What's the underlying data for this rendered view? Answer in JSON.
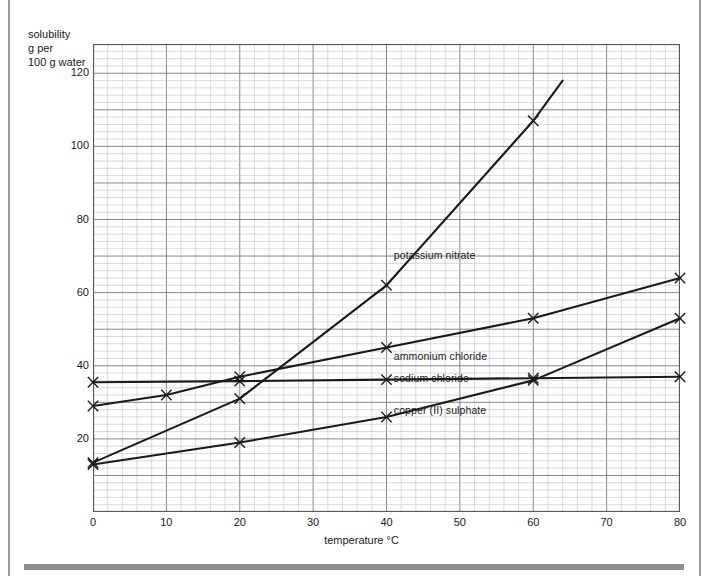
{
  "chart_data": {
    "type": "line",
    "title": "",
    "xlabel": "temperature °C",
    "ylabel": "solubility g per 100 g water",
    "ylabel_lines": [
      "solubility",
      "g per",
      "100 g water"
    ],
    "xlim": [
      0,
      80
    ],
    "ylim": [
      0,
      128
    ],
    "xticks": [
      0,
      10,
      20,
      30,
      40,
      50,
      60,
      70,
      80
    ],
    "yticks": [
      20,
      40,
      60,
      80,
      100,
      120
    ],
    "grid": true,
    "grid_minor_step_x": 2,
    "grid_minor_step_y": 2,
    "grid_major_step_x": 10,
    "grid_major_step_y": 10,
    "legend_position": "inline-labels",
    "marker": "x",
    "series": [
      {
        "name": "potassium nitrate",
        "label": "potassium nitrate",
        "color": "#1a1a1a",
        "label_x": 41,
        "label_y": 70,
        "x": [
          0,
          20,
          40,
          60,
          64
        ],
        "y": [
          13.5,
          31,
          62,
          107,
          118
        ],
        "markers_at": [
          0,
          20,
          40,
          60
        ]
      },
      {
        "name": "ammonium chloride",
        "label": "ammonium chloride",
        "color": "#1a1a1a",
        "label_x": 41,
        "label_y": 42.5,
        "x": [
          0,
          10,
          20,
          40,
          60,
          80
        ],
        "y": [
          29,
          32,
          37,
          45,
          53,
          64
        ],
        "markers_at": [
          0,
          10,
          20,
          40,
          60,
          80
        ]
      },
      {
        "name": "sodium chloride",
        "label": "sodium chloride",
        "color": "#1a1a1a",
        "label_x": 41,
        "label_y": 36.5,
        "x": [
          0,
          20,
          40,
          60,
          80
        ],
        "y": [
          35.5,
          35.8,
          36.2,
          36.6,
          37
        ],
        "markers_at": [
          0,
          20,
          40,
          60,
          80
        ]
      },
      {
        "name": "copper (II) sulphate",
        "label": "copper (II) sulphate",
        "color": "#1a1a1a",
        "label_x": 41,
        "label_y": 27.5,
        "x": [
          0,
          20,
          40,
          60,
          80
        ],
        "y": [
          13,
          19,
          26,
          36,
          53
        ],
        "markers_at": [
          0,
          20,
          40,
          60,
          80
        ]
      }
    ]
  },
  "colors": {
    "curve": "#1a1a1a",
    "grid_minor": "#b9b9c4",
    "grid_major": "#7a7a86",
    "axis": "#555560",
    "frame_rule": "#9a9a9a",
    "bottom_rule": "#8e8e8e",
    "text": "#1a1a1a",
    "background": "#ffffff"
  }
}
